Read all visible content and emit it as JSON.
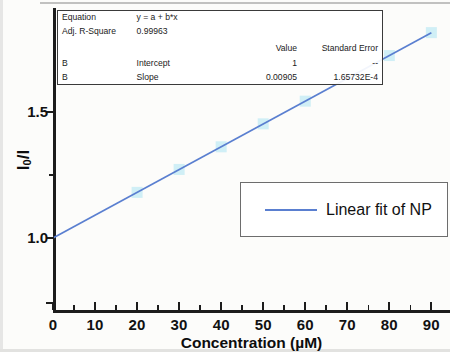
{
  "chart_data": {
    "type": "scatter",
    "title": "",
    "xlabel": "Concentration (µM)",
    "ylabel": "I0/I",
    "ylabel_main": "I",
    "ylabel_sub": "0",
    "ylabel_tail": "/I",
    "xlim": [
      0,
      93
    ],
    "ylim": [
      0.86,
      1.93
    ],
    "grid": false,
    "xticks": [
      0,
      10,
      20,
      30,
      40,
      50,
      60,
      70,
      80,
      90
    ],
    "xtick_labels": [
      "0",
      "10",
      "20",
      "30",
      "40",
      "50",
      "60",
      "70",
      "80",
      "90"
    ],
    "xminor_ticks": [
      5,
      15,
      25,
      35,
      45,
      55,
      65,
      75,
      85
    ],
    "yticks": [
      1.0,
      1.5
    ],
    "ytick_labels": [
      "1.0",
      "1.5"
    ],
    "yminor_ticks": [
      1.25
    ],
    "series": [
      {
        "name": "NP",
        "type": "scatter",
        "marker": "square",
        "color": "#c8ecf5",
        "x": [
          20,
          30,
          40,
          50,
          60,
          80,
          90
        ],
        "y": [
          1.181,
          1.272,
          1.362,
          1.453,
          1.543,
          1.724,
          1.815
        ]
      },
      {
        "name": "Linear fit of NP",
        "type": "line",
        "color": "#5a7fd0",
        "x": [
          0,
          90
        ],
        "y": [
          1.0,
          1.8145
        ]
      }
    ],
    "fit": {
      "equation": "y = a + b*x",
      "intercept": 1,
      "slope": 0.00905,
      "adj_r_square": 0.99963
    },
    "legend": {
      "position": "lower-right",
      "entries": [
        {
          "label": "Linear fit of NP",
          "color": "#5a7fd0",
          "marker": "line"
        }
      ]
    }
  },
  "stats_table": {
    "rows": [
      {
        "name": "Equation",
        "param": "y = a + b*x",
        "value": "",
        "se": ""
      },
      {
        "name": "Adj. R-Square",
        "param": "0.99963",
        "value": "",
        "se": ""
      }
    ],
    "header": {
      "name": "",
      "param": "",
      "value": "Value",
      "se": "Standard Error"
    },
    "coef_rows": [
      {
        "name": "B",
        "param": "Intercept",
        "value": "1",
        "se": "--"
      },
      {
        "name": "B",
        "param": "Slope",
        "value": "0.00905",
        "se": "1.65732E-4"
      }
    ]
  },
  "axis": {
    "x_title": "Concentration (µM)",
    "y_title_main": "I",
    "y_title_sub": "0",
    "y_title_tail": "/I"
  },
  "legend": {
    "fit_label": "Linear fit of NP"
  },
  "colors": {
    "fit_line": "#5a7fd0",
    "marker": "#c8ecf5",
    "axis": "#1c1c1c",
    "background": "#fcfcfa"
  }
}
